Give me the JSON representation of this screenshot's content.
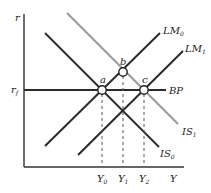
{
  "diagram": {
    "type": "IS-LM-BP",
    "axes": {
      "y_label": "r",
      "x_label": "Y",
      "rf_label_main": "r",
      "rf_label_sub": "f"
    },
    "curves": {
      "lm0": {
        "main": "LM",
        "sub": "0"
      },
      "lm1": {
        "main": "LM",
        "sub": "1"
      },
      "is0": {
        "main": "IS",
        "sub": "0"
      },
      "is1": {
        "main": "IS",
        "sub": "1"
      },
      "bp": {
        "main": "BP"
      }
    },
    "points": {
      "a": "a",
      "b": "b",
      "c": "c"
    },
    "x_ticks": [
      {
        "main": "Y",
        "sub": "0"
      },
      {
        "main": "Y",
        "sub": "1"
      },
      {
        "main": "Y",
        "sub": "2"
      }
    ],
    "colors": {
      "dark_line": "#2a2a2a",
      "gray_line": "#9a9a9a",
      "axis": "#333333"
    }
  }
}
